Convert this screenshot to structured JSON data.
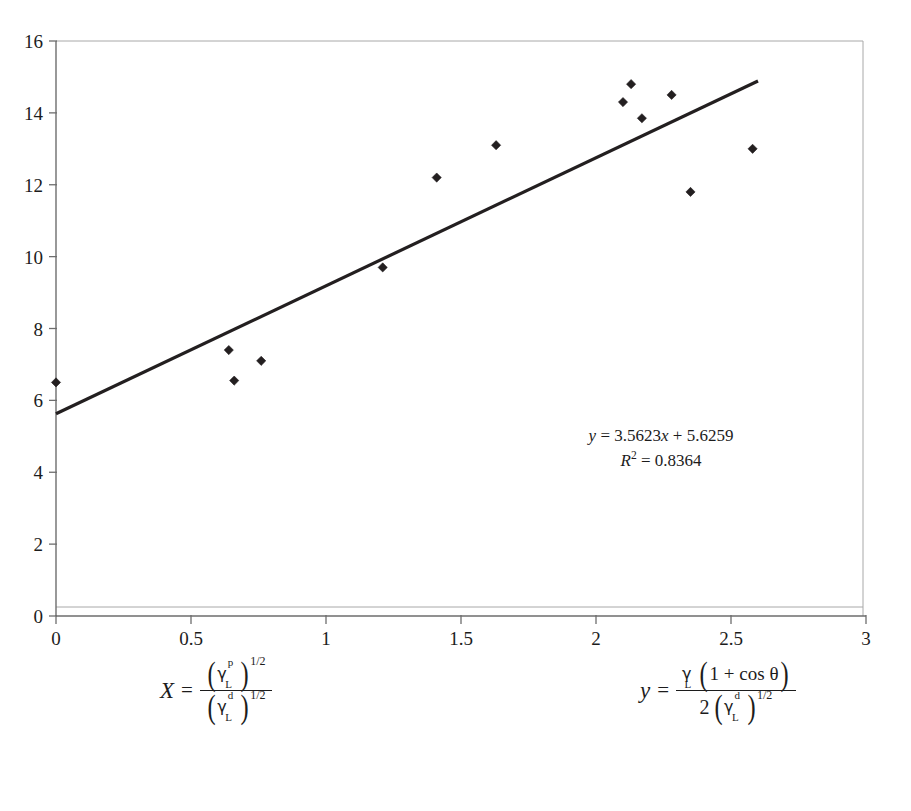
{
  "chart_data": {
    "type": "scatter",
    "title": "",
    "subtitle": "",
    "xlabel": "X = (gamma_L^p)^(1/2) / (gamma_L^d)^(1/2)",
    "ylabel": "y = gamma_L(1 + cos theta) / [2 (gamma_L^d)^(1/2)]",
    "xlim": [
      0,
      3
    ],
    "ylim": [
      0,
      16
    ],
    "xticks": [
      "0",
      "0.5",
      "1",
      "1.5",
      "2",
      "2.5",
      "3"
    ],
    "xtick_values": [
      0,
      0.5,
      1,
      1.5,
      2,
      2.5,
      3
    ],
    "yticks": [
      "0",
      "2",
      "4",
      "6",
      "8",
      "10",
      "12",
      "14",
      "16"
    ],
    "ytick_values": [
      0,
      2,
      4,
      6,
      8,
      10,
      12,
      14,
      16
    ],
    "grid": false,
    "legend": "none",
    "marker": "diamond",
    "marker_color": "#231f20",
    "series": [
      {
        "name": "measurements",
        "points": [
          [
            0.0,
            6.5
          ],
          [
            0.64,
            7.4
          ],
          [
            0.66,
            6.55
          ],
          [
            0.76,
            7.1
          ],
          [
            1.21,
            9.7
          ],
          [
            1.41,
            12.2
          ],
          [
            1.63,
            13.1
          ],
          [
            2.1,
            14.3
          ],
          [
            2.13,
            14.8
          ],
          [
            2.17,
            13.85
          ],
          [
            2.28,
            14.5
          ],
          [
            2.35,
            11.8
          ],
          [
            2.58,
            13.0
          ]
        ]
      }
    ],
    "trendline": {
      "type": "linear",
      "slope": 3.5623,
      "intercept": 5.6259,
      "r_squared": 0.8364,
      "x_start": 0.0,
      "x_end": 2.6,
      "color": "#231f20"
    },
    "annotations": {
      "equation_prefix_y": "y",
      "equation_body": " = 3.5623",
      "equation_x_var": "x",
      "equation_suffix": " + 5.6259",
      "r2_prefix": "R",
      "r2_exponent": "2",
      "r2_value": " = 0.8364"
    }
  },
  "axis_formulas": {
    "x_formula": {
      "lhs": "X",
      "equals": "=",
      "numerator_symbol": "γ",
      "numerator_superscript": "p",
      "numerator_subscript": "L",
      "numerator_power": "1/2",
      "denominator_symbol": "γ",
      "denominator_superscript": "d",
      "denominator_subscript": "L",
      "denominator_power": "1/2"
    },
    "y_formula": {
      "lhs": "y",
      "equals": "=",
      "numerator_symbol": "γ",
      "numerator_subscript": "L",
      "numerator_expression": "1 + cos θ",
      "denominator_coefficient": "2",
      "denominator_symbol": "γ",
      "denominator_superscript": "d",
      "denominator_subscript": "L",
      "denominator_power": "1/2"
    }
  },
  "style": {
    "background": "#ffffff",
    "axis_color": "#6d6d6d",
    "frame_color": "#a8a8a8",
    "text_color": "#1c1c1c",
    "data_color": "#231f20"
  }
}
